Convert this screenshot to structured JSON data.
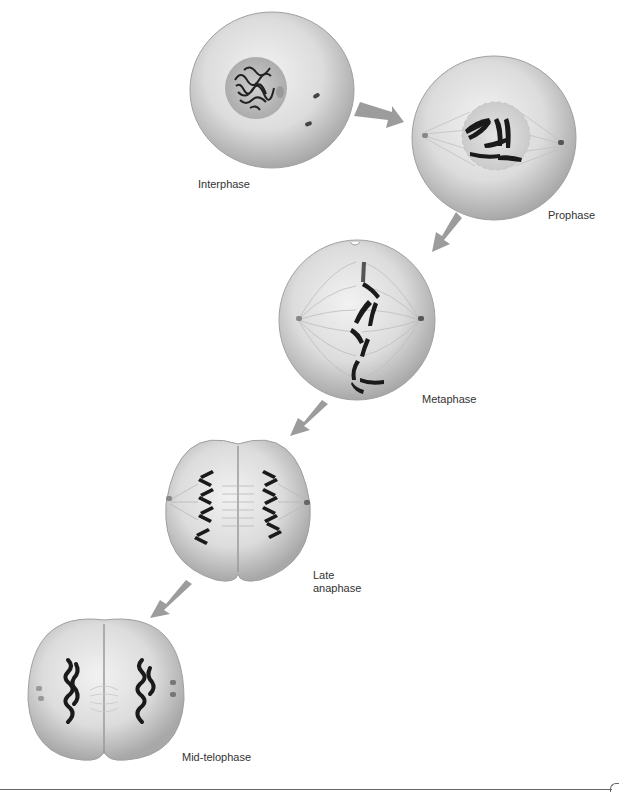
{
  "figure": {
    "stages": [
      {
        "id": "interphase",
        "label": "Interphase"
      },
      {
        "id": "prophase",
        "label": "Prophase"
      },
      {
        "id": "metaphase",
        "label": "Metaphase"
      },
      {
        "id": "late-anaphase",
        "label_line1": "Late",
        "label_line2": "anaphase"
      },
      {
        "id": "mid-telophase",
        "label": "Mid-telophase"
      }
    ],
    "colors": {
      "cell_fill": "#d9d9d9",
      "cell_edge": "#9a9a9a",
      "chromosome": "#1a1a1a",
      "arrow": "#9c9c9c",
      "spindle": "#b8b8b8",
      "nucleus": "#bdbdbd"
    }
  }
}
